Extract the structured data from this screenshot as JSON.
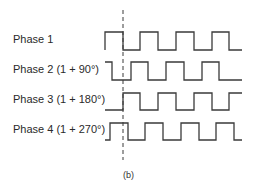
{
  "diagram": {
    "caption": "(b)",
    "stroke_color": "#3a3a3a",
    "reference_line": {
      "x": 123,
      "y_top": 10,
      "y_bottom": 160,
      "style": "dashed"
    },
    "phases": [
      {
        "label": "Phase 1",
        "label_top": 32,
        "high_y": 32,
        "low_y": 50,
        "points": "105,50 105,32 123,32 123,50 140,50 140,32 158,32 158,50 176,50 176,32 194,32 194,50 212,50 212,32 229,32 229,50 242,50"
      },
      {
        "label": "Phase 2 (1 + 90°)",
        "label_top": 62,
        "high_y": 62,
        "low_y": 80,
        "points": "105,62 112,62 112,80 131,80 131,62 148,62 148,80 166,80 166,62 184,62 184,80 202,80 202,62 219,62 219,80 242,80"
      },
      {
        "label": "Phase 3 (1 + 180°)",
        "label_top": 92,
        "high_y": 93,
        "low_y": 110,
        "points": "105,110 123,110 123,93 140,93 140,110 158,110 158,93 176,93 176,110 194,110 194,93 212,93 212,110 229,110 229,93 242,93"
      },
      {
        "label": "Phase 4 (1 + 270°)",
        "label_top": 122,
        "high_y": 123,
        "low_y": 140,
        "points": "105,140 110,140 110,123 128,123 128,140 145,140 145,123 163,123 163,140 181,140 181,123 199,123 199,140 216,140 216,123 234,123 234,140 242,140"
      }
    ]
  }
}
